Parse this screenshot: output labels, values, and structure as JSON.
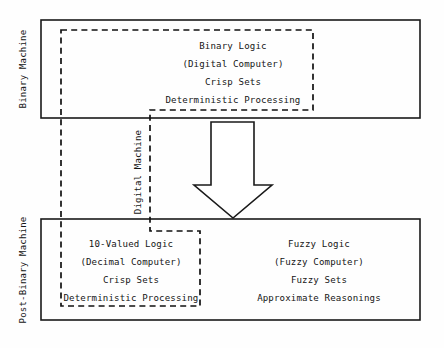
{
  "diagram": {
    "background_color": "#fefefe",
    "line_color": "#1a1a1a",
    "text_color": "#151515"
  },
  "side_labels": {
    "binary_machine": "Binary Machine",
    "post_binary_machine": "Post-Binary Machine",
    "digital_machine": "Digital Machine"
  },
  "top_box": {
    "name": "Binary Machine",
    "lines": [
      "Binary Logic",
      "(Digital Computer)",
      "Crisp Sets",
      "Deterministic Processing"
    ]
  },
  "bottom_box": {
    "name": "Post-Binary Machine",
    "left_group": {
      "lines": [
        "10-Valued Logic",
        "(Decimal Computer)",
        "Crisp Sets",
        "Deterministic Processing"
      ]
    },
    "right_group": {
      "lines": [
        "Fuzzy Logic",
        "(Fuzzy Computer)",
        "Fuzzy Sets",
        "Approximate Reasonings"
      ]
    }
  },
  "arrow": {
    "direction": "down",
    "label": ""
  }
}
